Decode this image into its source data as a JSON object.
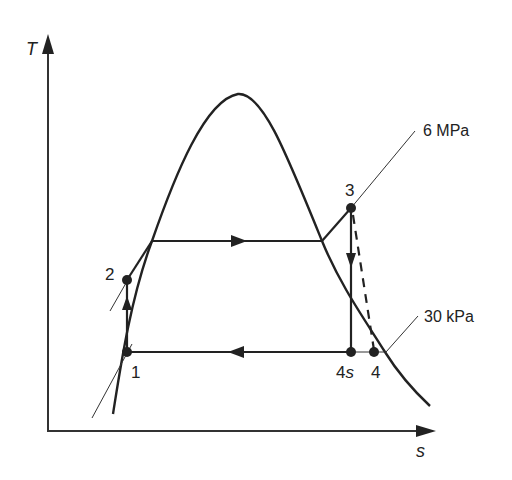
{
  "diagram": {
    "type": "T-s diagram (Rankine cycle)",
    "axes": {
      "y_label": "T",
      "x_label": "s"
    },
    "pressure_lines": [
      {
        "label": "6 MPa",
        "through_point": "3"
      },
      {
        "label": "30 kPa",
        "through_point": "4"
      }
    ],
    "points": [
      {
        "id": "1",
        "label": "1"
      },
      {
        "id": "2",
        "label": "2"
      },
      {
        "id": "3",
        "label": "3"
      },
      {
        "id": "4s",
        "label_main": "4",
        "label_sub": "s"
      },
      {
        "id": "4",
        "label": "4"
      }
    ],
    "processes": [
      {
        "from": "1",
        "to": "2",
        "type": "pump (isentropic compression)",
        "arrow": "up"
      },
      {
        "from": "2",
        "to": "3",
        "type": "boiler heat addition at 6 MPa",
        "arrow": "right"
      },
      {
        "from": "3",
        "to": "4s",
        "type": "isentropic turbine expansion",
        "arrow": "down"
      },
      {
        "from": "3",
        "to": "4",
        "type": "actual turbine expansion",
        "style": "dashed"
      },
      {
        "from": "4",
        "to": "1",
        "type": "condenser heat rejection at 30 kPa",
        "arrow": "left"
      }
    ],
    "colors": {
      "line": "#222222",
      "background": "#ffffff"
    }
  }
}
